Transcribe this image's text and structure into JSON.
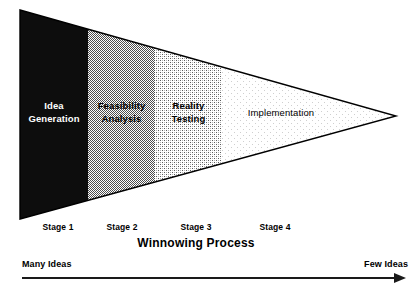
{
  "diagram": {
    "title": "Winnowing Process",
    "type": "funnel",
    "bands": [
      {
        "id": "stage-1",
        "line1": "Idea",
        "line2": "Generation",
        "tick": "Stage 1",
        "fill": "#000000",
        "text_color": "#FFFFFF",
        "x_start_pct": 0,
        "x_end_pct": 18.1
      },
      {
        "id": "stage-2",
        "line1": "Feasibility",
        "line2": "Analysis",
        "tick": "Stage 2",
        "fill": "#A8A8A8",
        "text_color": "#000000",
        "x_start_pct": 18.1,
        "x_end_pct": 36.0
      },
      {
        "id": "stage-3",
        "line1": "Reality",
        "line2": "Testing",
        "tick": "Stage 3",
        "fill": "#D6D6D6",
        "text_color": "#000000",
        "x_start_pct": 36.0,
        "x_end_pct": 53.9
      },
      {
        "id": "stage-4",
        "line1": "Implementation",
        "line2": "",
        "tick": "Stage 4",
        "fill": "#F4F4F4",
        "text_color": "#000000",
        "x_start_pct": 53.9,
        "x_end_pct": 100
      }
    ],
    "axis": {
      "left_label": "Many Ideas",
      "right_label": "Few Ideas",
      "direction": "left-to-right"
    },
    "colors": {
      "outline": "#000000",
      "background": "#FFFFFF",
      "arrow": "#1A1A1A"
    }
  }
}
